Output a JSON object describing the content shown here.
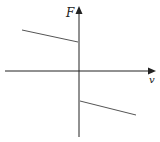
{
  "diagram": {
    "title": "",
    "axes": {
      "y_label": "F",
      "x_label": "v"
    },
    "colors": {
      "axis": "#222222",
      "line": "#555555"
    },
    "segments": [
      {
        "name": "positive-branch",
        "description": "F positive for v<0, decreasing slightly toward origin",
        "from": [
          22,
          30
        ],
        "to": [
          78,
          42
        ]
      },
      {
        "name": "negative-branch",
        "description": "F negative for v>0, decreasing with v",
        "from": [
          80,
          101
        ],
        "to": [
          136,
          115
        ]
      }
    ]
  }
}
